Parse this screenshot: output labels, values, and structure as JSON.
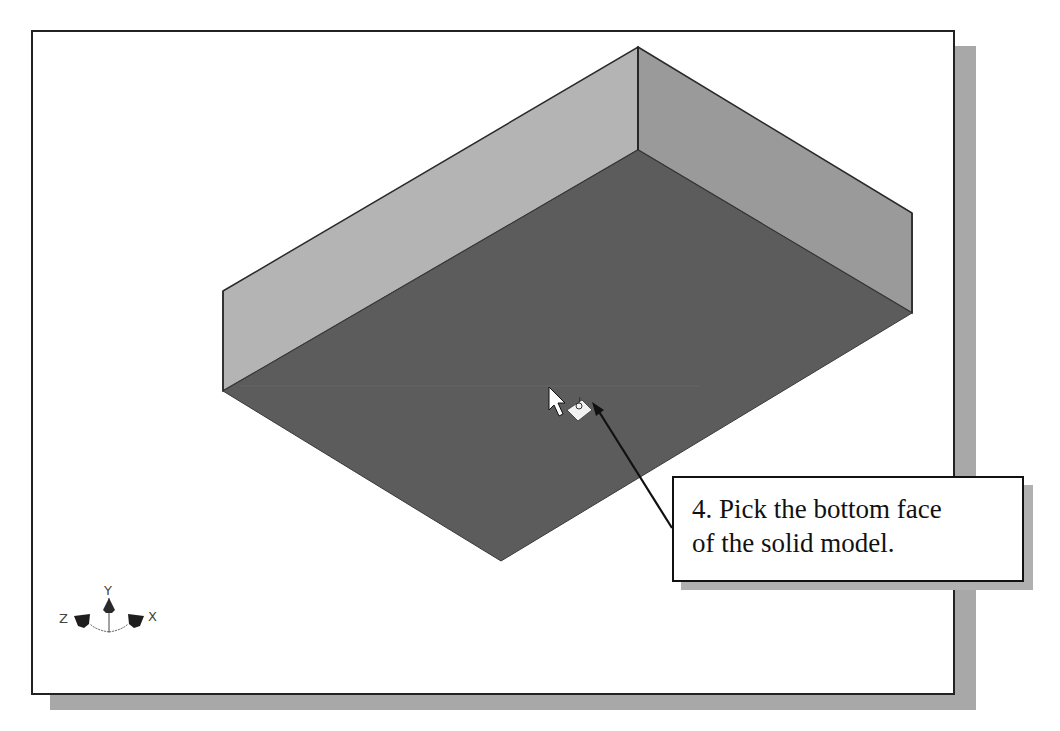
{
  "viewport": {
    "background": "#ffffff",
    "border_color": "#222222",
    "shadow_color": "#a8a8a8"
  },
  "model": {
    "name": "solid-box-shell",
    "faces": {
      "left_wall_color": "#b4b4b4",
      "right_wall_color": "#9a9a9a",
      "bottom_face_color": "#5c5c5c",
      "edge_color": "#2a2a2a"
    },
    "cursor": {
      "icon": "arrow-pointer-icon",
      "select_icon": "face-select-icon"
    }
  },
  "triad": {
    "x_label": "X",
    "y_label": "Y",
    "z_label": "Z"
  },
  "callout": {
    "line1": "4. Pick the bottom face",
    "line2": "of the solid model."
  }
}
